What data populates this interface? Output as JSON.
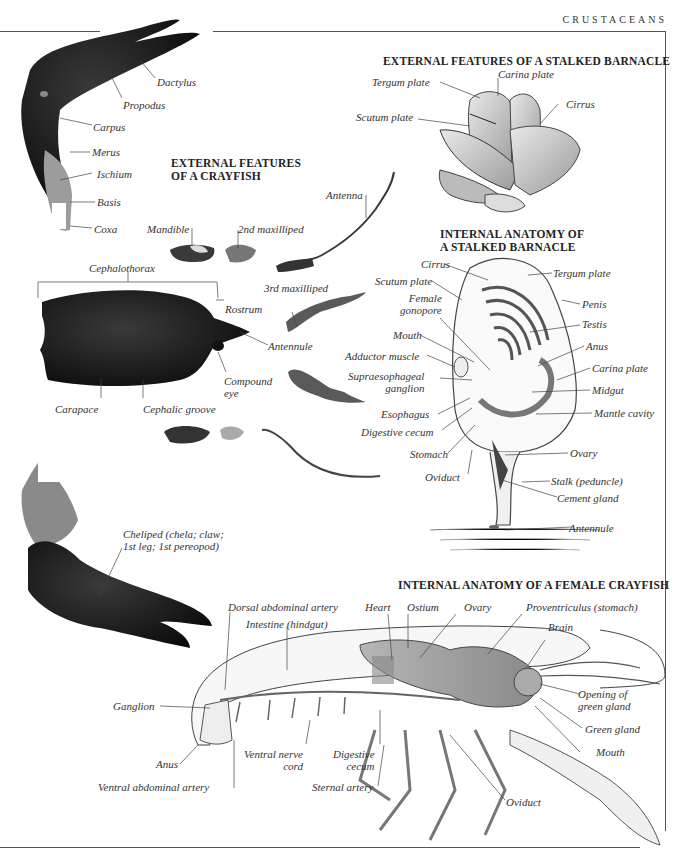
{
  "running_head": "CRUSTACEANS",
  "sections": {
    "claw_detail": {
      "labels": [
        "Dactylus",
        "Propodus",
        "Carpus",
        "Merus",
        "Ischium",
        "Basis",
        "Coxa"
      ]
    },
    "external_crayfish": {
      "title_line1": "EXTERNAL FEATURES",
      "title_line2": "OF A CRAYFISH",
      "labels": {
        "mandible": "Mandible",
        "maxilliped2": "2nd maxilliped",
        "antenna": "Antenna",
        "cephalothorax": "Cephalothorax",
        "maxilliped3": "3rd maxilliped",
        "rostrum": "Rostrum",
        "antennule": "Antennule",
        "compound_eye_1": "Compound",
        "compound_eye_2": "eye",
        "carapace": "Carapace",
        "cephalic_groove": "Cephalic groove",
        "cheliped_1": "Cheliped (chela; claw;",
        "cheliped_2": "1st leg; 1st pereopod)"
      }
    },
    "external_barnacle": {
      "title": "EXTERNAL FEATURES OF A STALKED BARNACLE",
      "labels": {
        "tergum": "Tergum plate",
        "carina": "Carina plate",
        "scutum": "Scutum plate",
        "cirrus": "Cirrus"
      }
    },
    "internal_barnacle": {
      "title_line1": "INTERNAL ANATOMY OF",
      "title_line2": "A STALKED BARNACLE",
      "labels": {
        "cirrus": "Cirrus",
        "tergum": "Tergum plate",
        "scutum": "Scutum plate",
        "female_gonopore_1": "Female",
        "female_gonopore_2": "gonopore",
        "penis": "Penis",
        "testis": "Testis",
        "mouth": "Mouth",
        "anus": "Anus",
        "adductor": "Adductor muscle",
        "carina": "Carina plate",
        "supra_1": "Supraesophageal",
        "supra_2": "ganglion",
        "midgut": "Midgut",
        "esophagus": "Esophagus",
        "mantle": "Mantle cavity",
        "digestive_cecum": "Digestive cecum",
        "ovary": "Ovary",
        "stomach": "Stomach",
        "oviduct": "Oviduct",
        "stalk": "Stalk (peduncle)",
        "cement": "Cement gland",
        "antennule": "Antennule"
      }
    },
    "internal_crayfish": {
      "title": "INTERNAL ANATOMY OF A FEMALE CRAYFISH",
      "labels": {
        "dorsal_artery": "Dorsal abdominal artery",
        "heart": "Heart",
        "ostium": "Ostium",
        "ovary": "Ovary",
        "proventriculus": "Proventriculus (stomach)",
        "intestine": "Intestine (hindgut)",
        "brain": "Brain",
        "ganglion": "Ganglion",
        "opening_1": "Opening of",
        "opening_2": "green gland",
        "green_gland": "Green gland",
        "anus": "Anus",
        "nerve_1": "Ventral nerve",
        "nerve_2": "cord",
        "cecum_1": "Digestive",
        "cecum_2": "cecum",
        "mouth": "Mouth",
        "ventral_artery": "Ventral abdominal artery",
        "sternal_artery": "Sternal artery",
        "oviduct": "Oviduct"
      }
    }
  }
}
